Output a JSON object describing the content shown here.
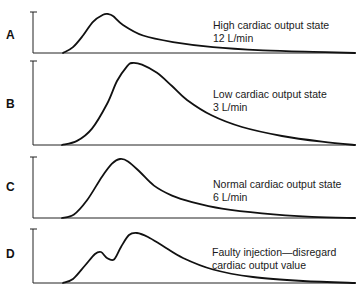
{
  "chart_data": {
    "type": "line",
    "title": "",
    "xlabel": "Time",
    "ylabel": "Temperature change",
    "grid": false,
    "panels": [
      {
        "id": "A",
        "label": "A",
        "annotation": [
          "High cardiac output state",
          "12 L/min"
        ],
        "x": [
          0,
          10,
          20,
          30,
          40,
          45,
          50,
          60,
          80,
          110,
          150,
          200,
          250,
          292
        ],
        "y": [
          0,
          0.15,
          0.45,
          0.8,
          0.98,
          1.0,
          0.95,
          0.72,
          0.45,
          0.28,
          0.15,
          0.07,
          0.03,
          0.0
        ]
      },
      {
        "id": "B",
        "label": "B",
        "annotation": [
          "Low cardiac output state",
          "3 L/min"
        ],
        "x": [
          0,
          15,
          30,
          45,
          55,
          65,
          70,
          80,
          95,
          110,
          125,
          150,
          180,
          220,
          260,
          293
        ],
        "y": [
          0,
          0.05,
          0.2,
          0.5,
          0.78,
          0.96,
          1.0,
          0.98,
          0.88,
          0.72,
          0.55,
          0.36,
          0.22,
          0.11,
          0.04,
          0.0
        ]
      },
      {
        "id": "C",
        "label": "C",
        "annotation": [
          "Normal cardiac output state",
          "6 L/min"
        ],
        "x": [
          0,
          12,
          25,
          40,
          50,
          58,
          66,
          78,
          92,
          110,
          130,
          160,
          200,
          250,
          293
        ],
        "y": [
          0,
          0.06,
          0.3,
          0.7,
          0.92,
          1.0,
          0.96,
          0.78,
          0.55,
          0.38,
          0.27,
          0.16,
          0.08,
          0.02,
          0.0
        ]
      },
      {
        "id": "D",
        "label": "D",
        "annotation": [
          "Faulty injection—disregard",
          "cardiac output value"
        ],
        "x": [
          0,
          10,
          22,
          32,
          38,
          44,
          51,
          58,
          66,
          74,
          85,
          100,
          120,
          150,
          190,
          240,
          292
        ],
        "y": [
          0,
          0.08,
          0.35,
          0.58,
          0.62,
          0.5,
          0.47,
          0.72,
          0.96,
          1.0,
          0.92,
          0.74,
          0.5,
          0.27,
          0.12,
          0.04,
          0.0
        ]
      }
    ]
  }
}
